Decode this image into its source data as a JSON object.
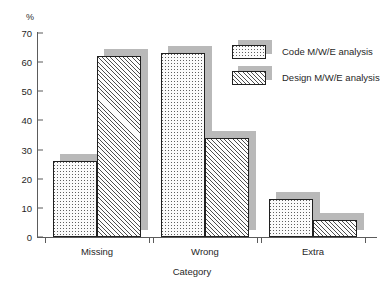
{
  "chart_data": {
    "type": "bar",
    "title": "",
    "categories": [
      "Missing",
      "Wrong",
      "Extra"
    ],
    "series": [
      {
        "name": "Code M/W/E analysis",
        "pattern": "dotted",
        "values": [
          26,
          63,
          13
        ]
      },
      {
        "name": "Design M/W/E analysis",
        "pattern": "diagonal-hatch",
        "values": [
          62,
          34,
          6
        ]
      }
    ],
    "xlabel": "Category",
    "ylabel": "%",
    "ylim": [
      0,
      70
    ],
    "yticks": [
      0,
      10,
      20,
      30,
      40,
      50,
      60,
      70
    ],
    "ytick_labels": [
      "0",
      "10",
      "20",
      "30",
      "40",
      "50",
      "60",
      "70"
    ],
    "grid": false,
    "legend_position": "upper-right",
    "colors": {
      "bar_outline": "#202020",
      "bar_fill": "#ffffff",
      "pattern_ink": "#4d4d4d",
      "shadow": "#b9b9b9",
      "axis": "#5b5b5b",
      "text": "#1f1f1f",
      "background": "#ffffff"
    }
  },
  "axis": {
    "y_unit_label": "%",
    "x_title": "Category"
  },
  "legend": {
    "entries": [
      {
        "label": "Code M/W/E analysis"
      },
      {
        "label": "Design M/W/E analysis"
      }
    ]
  }
}
